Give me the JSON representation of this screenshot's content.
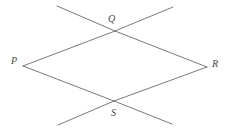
{
  "figure": {
    "background_color": "#ffffff",
    "stroke_color": "#6b6b6b",
    "label_color": "#4a4a4a",
    "stroke_width": 0.9,
    "canvas": {
      "width": 230,
      "height": 131
    }
  },
  "points": {
    "P": {
      "label": "P",
      "x": 23,
      "y": 66,
      "label_x": 11,
      "label_y": 56
    },
    "Q": {
      "label": "Q",
      "x": 115,
      "y": 31,
      "label_x": 108,
      "label_y": 14
    },
    "R": {
      "label": "R",
      "x": 207,
      "y": 67,
      "label_x": 212,
      "label_y": 59
    },
    "S": {
      "label": "S",
      "x": 114,
      "y": 101,
      "label_x": 111,
      "label_y": 108
    }
  },
  "segments": [
    {
      "name": "side-PQ",
      "from": "P",
      "to": "Q",
      "x1": 23,
      "y1": 66,
      "x2": 115,
      "y2": 31
    },
    {
      "name": "side-QR",
      "from": "Q",
      "to": "R",
      "x1": 115,
      "y1": 31,
      "x2": 207,
      "y2": 67
    },
    {
      "name": "side-RS",
      "from": "R",
      "to": "S",
      "x1": 207,
      "y1": 67,
      "x2": 114,
      "y2": 101
    },
    {
      "name": "side-SP",
      "from": "S",
      "to": "P",
      "x1": 114,
      "y1": 101,
      "x2": 23,
      "y2": 66
    },
    {
      "name": "extension-through-Q-upper-left",
      "from": "Q",
      "to": "top-left-end",
      "x1": 115,
      "y1": 31,
      "x2": 57,
      "y2": 6
    },
    {
      "name": "extension-through-Q-upper-right",
      "from": "Q",
      "to": "top-right-end",
      "x1": 115,
      "y1": 31,
      "x2": 173,
      "y2": 7
    },
    {
      "name": "extension-through-S-lower-left",
      "from": "S",
      "to": "bottom-left-end",
      "x1": 114,
      "y1": 101,
      "x2": 58,
      "y2": 125
    },
    {
      "name": "extension-through-S-lower-right",
      "from": "S",
      "to": "bottom-right-end",
      "x1": 114,
      "y1": 101,
      "x2": 172,
      "y2": 124
    }
  ]
}
